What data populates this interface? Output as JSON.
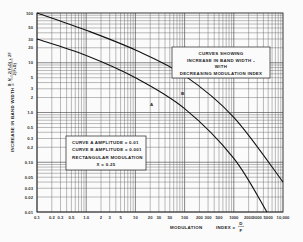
{
  "chart_data": {
    "type": "line",
    "title": "",
    "xlabel": "MODULATION INDEX = D/F",
    "ylabel": "INCREASE IN BAND WIDTH = (B_M - 2(F+D) + 2F) / 2(F+D)",
    "xscale": "log",
    "yscale": "log",
    "xlim": [
      0.1,
      10000
    ],
    "ylim": [
      0.01,
      100
    ],
    "grid": true,
    "x_ticks": [
      "0.1",
      "0.2",
      "0.3",
      "0.5",
      "1.0",
      "2",
      "3",
      "5",
      "10",
      "20",
      "30",
      "50",
      "100",
      "200",
      "300",
      "500",
      "1000",
      "2000",
      "3000",
      "5000",
      "10,000"
    ],
    "x_tick_values": [
      0.1,
      0.2,
      0.3,
      0.5,
      1,
      2,
      3,
      5,
      10,
      20,
      30,
      50,
      100,
      200,
      300,
      500,
      1000,
      2000,
      3000,
      5000,
      10000
    ],
    "y_ticks": [
      "100",
      "50",
      "30",
      "20",
      "10",
      "5",
      "3",
      "2",
      "1.0",
      "0.5",
      "0.3",
      "0.2",
      "0.10",
      "0.05",
      "0.03",
      "0.02",
      "0.01"
    ],
    "y_tick_values": [
      100,
      50,
      30,
      20,
      10,
      5,
      3,
      2,
      1,
      0.5,
      0.3,
      0.2,
      0.1,
      0.05,
      0.03,
      0.02,
      0.01
    ],
    "series": [
      {
        "name": "B",
        "label": "CURVE B  AMPLITUDE = 0.001",
        "x": [
          0.1,
          1,
          10,
          100,
          1000,
          10000
        ],
        "y": [
          100,
          45,
          18,
          5.5,
          0.8,
          0.04
        ]
      },
      {
        "name": "A",
        "label": "CURVE A  AMPLITUDE = 0.01",
        "x": [
          0.1,
          1,
          10,
          100,
          1000,
          4700
        ],
        "y": [
          30,
          14,
          5,
          1.2,
          0.12,
          0.01
        ]
      }
    ],
    "annotations": [
      {
        "text": "A",
        "x": 30,
        "y": 2.2
      },
      {
        "text": "B",
        "x": 120,
        "y": 4.2
      }
    ],
    "legend_boxes": [
      {
        "lines": [
          "CURVES  SHOWING",
          "INCREASE  IN  BAND  WIDTH  ₁",
          "WITH",
          "DECREASING  MODULATION  INDEX"
        ]
      },
      {
        "lines": [
          "CURVE  A   AMPLITUDE = 0.01",
          "CURVE  B   AMPLITUDE = 0.001",
          "RECTANGULAR        MODULATION",
          "X = 0.25"
        ]
      }
    ]
  },
  "axis": {
    "x_label_left": "MODULATION",
    "x_label_right": "INDEX  =",
    "x_frac_num": "D",
    "x_frac_den": "F",
    "y_label": "INCREASE  IN  BAND  WIDTH  =",
    "y_frac_num": "B_M - 2(F+D) + 2F",
    "y_frac_den": "2(F+D)"
  },
  "legend_top": {
    "line1": "CURVES  SHOWING",
    "line2": "INCREASE  IN  BAND  WIDTH  ₁",
    "line3": "WITH",
    "line4": "DECREASING  MODULATION  INDEX"
  },
  "legend_bottom": {
    "line1": "CURVE  A   AMPLITUDE = 0.01",
    "line2": "CURVE  B   AMPLITUDE = 0.001",
    "line3": "RECTANGULAR        MODULATION",
    "line4": "X = 0.25"
  },
  "curve_labels": {
    "a": "A",
    "b": "B"
  }
}
